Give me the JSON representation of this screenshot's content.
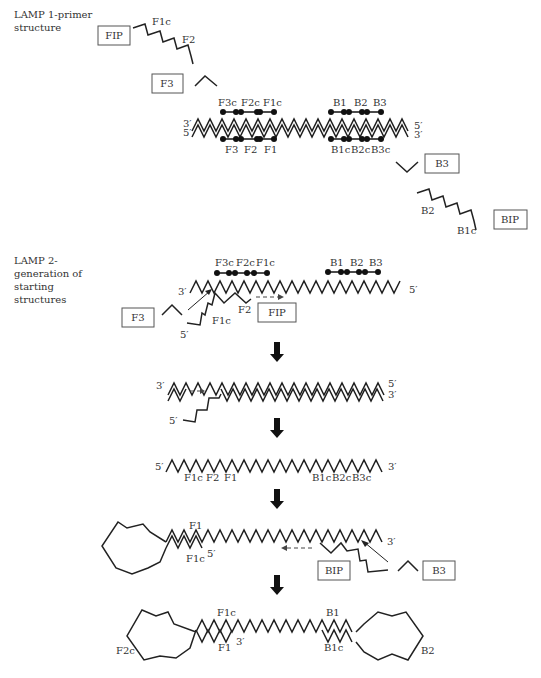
{
  "section1": {
    "title_line1": "LAMP 1-primer",
    "title_line2": "structure",
    "primers": {
      "FIP": "FIP",
      "F3": "F3",
      "B3": "B3",
      "BIP": "BIP"
    },
    "fip_labels": {
      "F1c": "F1c",
      "F2": "F2"
    },
    "bip_labels": {
      "B2": "B2",
      "B1c": "B1c"
    },
    "top_labels": [
      "F3c",
      "F2c",
      "F1c",
      "B1",
      "B2",
      "B3"
    ],
    "bottom_labels": [
      "F3",
      "F2",
      "F1",
      "B1c",
      "B2c",
      "B3c"
    ],
    "ends": {
      "top_left": "3′",
      "bottom_left": "5′",
      "top_right": "5′",
      "bottom_right": "3′"
    }
  },
  "section2": {
    "title_line1": "LAMP 2-",
    "title_line2": "generation of",
    "title_line3": "starting",
    "title_line4": "structures",
    "step1": {
      "top_labels": [
        "F3c",
        "F2c",
        "F1c",
        "B1",
        "B2",
        "B3"
      ],
      "left_end": "3′",
      "right_end": "5′",
      "primer_F3": "F3",
      "primer_FIP": "FIP",
      "label_F2": "F2",
      "label_F1c": "F1c",
      "label_5prime": "5′"
    },
    "step2": {
      "top_left": "3′",
      "top_right": "5′",
      "bottom_right": "3′",
      "tail_5prime": "5′"
    },
    "step3": {
      "left_end": "5′",
      "right_end": "3′",
      "labels": [
        "F1c",
        "F2",
        "F1",
        "B1c",
        "B2c",
        "B3c"
      ]
    },
    "step4": {
      "label_F1": "F1",
      "label_F1c": "F1c",
      "label_5prime": "5′",
      "label_3prime": "3′",
      "primer_BIP": "BIP",
      "primer_B3": "B3"
    },
    "step5": {
      "label_F1c": "F1c",
      "label_B1": "B1",
      "label_F1": "F1",
      "label_3prime": "3′",
      "label_B1c": "B1c",
      "label_F2c": "F2c",
      "label_B2": "B2"
    }
  }
}
